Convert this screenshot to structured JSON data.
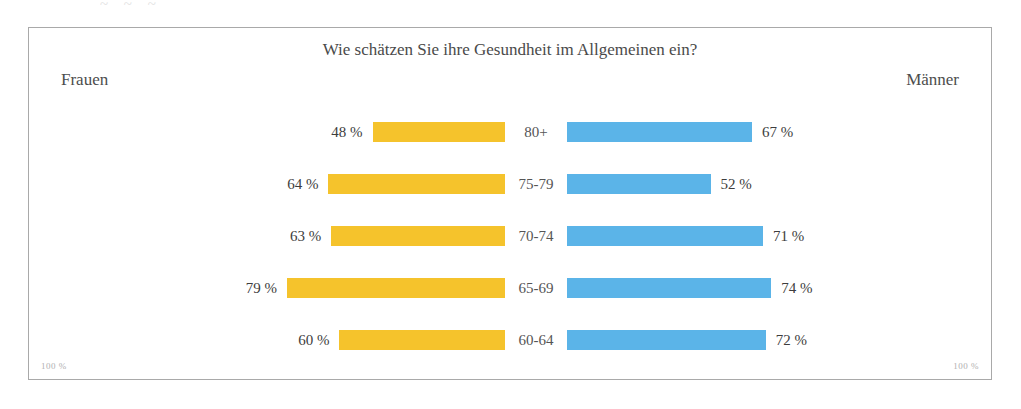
{
  "artifact_text": "~ ~   ~",
  "chart": {
    "title": "Wie schätzen Sie ihre Gesundheit im Allgemeinen ein?",
    "left_group_label": "Frauen",
    "right_group_label": "Männer",
    "axis_note_left": "100 %",
    "axis_note_right": "100 %",
    "female_color": "#f5c32c",
    "male_color": "#5bb4e8"
  },
  "chart_data": {
    "type": "bar",
    "orientation": "horizontal-diverging",
    "title": "Wie schätzen Sie ihre Gesundheit im Allgemeinen ein?",
    "xlabel": "",
    "ylabel": "",
    "xlim": [
      0,
      100
    ],
    "grid": false,
    "legend_position": "top-corners",
    "categories": [
      "80+",
      "75-79",
      "70-74",
      "65-69",
      "60-64"
    ],
    "series": [
      {
        "name": "Frauen",
        "color": "#f5c32c",
        "side": "left",
        "values": [
          48,
          64,
          63,
          79,
          60
        ],
        "value_labels": [
          "48 %",
          "64 %",
          "63 %",
          "79 %",
          "60 %"
        ]
      },
      {
        "name": "Männer",
        "color": "#5bb4e8",
        "side": "right",
        "values": [
          67,
          52,
          71,
          74,
          72
        ],
        "value_labels": [
          "67 %",
          "52 %",
          "71 %",
          "74 %",
          "72 %"
        ]
      }
    ],
    "rows": [
      {
        "category": "80+",
        "female": 48,
        "female_label": "48 %",
        "male": 67,
        "male_label": "67 %"
      },
      {
        "category": "75-79",
        "female": 64,
        "female_label": "64 %",
        "male": 52,
        "male_label": "52 %"
      },
      {
        "category": "70-74",
        "female": 63,
        "female_label": "63 %",
        "male": 71,
        "male_label": "71 %"
      },
      {
        "category": "65-69",
        "female": 79,
        "female_label": "79 %",
        "male": 74,
        "male_label": "74 %"
      },
      {
        "category": "60-64",
        "female": 60,
        "female_label": "60 %",
        "male": 72,
        "male_label": "72 %"
      }
    ],
    "annotations": [
      "100 %",
      "100 %"
    ]
  }
}
